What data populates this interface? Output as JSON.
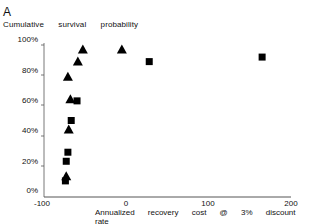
{
  "panel_label": "A",
  "chart_data": {
    "type": "scatter",
    "title": "",
    "panel": "A",
    "ylabel": "Cumulative survival probability",
    "xlabel": "Annualized recovery cost @ 3% discount rate",
    "xlim": [
      -100,
      200
    ],
    "ylim": [
      0,
      100
    ],
    "x_ticks": [
      "-100",
      "0",
      "100",
      "200"
    ],
    "y_ticks": [
      "0%",
      "20%",
      "40%",
      "60%",
      "80%",
      "100%"
    ],
    "grid": false,
    "series": [
      {
        "name": "triangle",
        "marker": "triangle",
        "points": [
          {
            "x": -72,
            "y": 13
          },
          {
            "x": -69,
            "y": 44
          },
          {
            "x": -67,
            "y": 64
          },
          {
            "x": -70,
            "y": 79
          },
          {
            "x": -58,
            "y": 89
          },
          {
            "x": -52,
            "y": 97
          },
          {
            "x": -5,
            "y": 97
          }
        ]
      },
      {
        "name": "square",
        "marker": "square",
        "points": [
          {
            "x": -73,
            "y": 10
          },
          {
            "x": -72,
            "y": 23
          },
          {
            "x": -70,
            "y": 29
          },
          {
            "x": -66,
            "y": 50
          },
          {
            "x": -59,
            "y": 63
          },
          {
            "x": 28,
            "y": 89
          },
          {
            "x": 164,
            "y": 92
          }
        ]
      }
    ]
  }
}
